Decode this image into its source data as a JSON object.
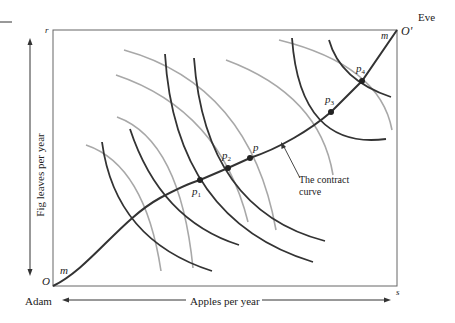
{
  "figure": {
    "corner_labels": {
      "top_left": "r",
      "top_right": "O'",
      "bottom_left": "O",
      "bottom_right": "s"
    },
    "agents": {
      "origin_agent": "Adam",
      "top_agent": "Eve"
    },
    "axis_labels": {
      "x": "Apples per year",
      "y": "Fig leaves per year"
    },
    "contract_curve_end_labels": {
      "near_origin": "m",
      "near_top": "m"
    },
    "points": [
      {
        "name": "p",
        "sub": "1",
        "x": 200,
        "y": 180
      },
      {
        "name": "p",
        "sub": "2",
        "x": 228,
        "y": 168
      },
      {
        "name": "p",
        "sub": "",
        "x": 250,
        "y": 158
      },
      {
        "name": "p",
        "sub": "3",
        "x": 331,
        "y": 112
      },
      {
        "name": "p",
        "sub": "4",
        "x": 362,
        "y": 81
      }
    ],
    "annotation": {
      "line1": "The contract",
      "line2": "curve"
    },
    "colors": {
      "adam_curves": "#333333",
      "eve_curves": "#a8a8a8",
      "box": "#555555",
      "contract_curve": "#333333"
    }
  }
}
